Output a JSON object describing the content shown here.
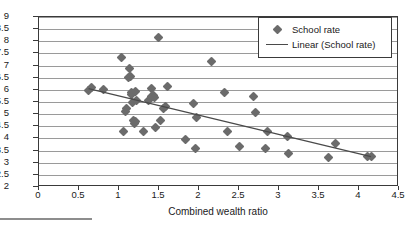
{
  "chart_data": {
    "type": "scatter",
    "title": "",
    "xlabel": "Combined wealth ratio",
    "ylabel": "",
    "xlim": [
      0,
      4.5
    ],
    "ylim": [
      2,
      9
    ],
    "xticks": [
      "0",
      "0.5",
      "1",
      "1.5",
      "2",
      "2.5",
      "3",
      "3.5",
      "4",
      "4.5"
    ],
    "xtick_values": [
      0,
      0.5,
      1,
      1.5,
      2,
      2.5,
      3,
      3.5,
      4,
      4.5
    ],
    "yticks": [
      "2",
      "2.5",
      "3",
      "3.5",
      "4",
      "4.5",
      "5",
      "5.5",
      "6",
      "6.5",
      "7",
      "7.5",
      "8",
      "8.5",
      "9"
    ],
    "ytick_values": [
      2,
      2.5,
      3,
      3.5,
      4,
      4.5,
      5,
      5.5,
      6,
      6.5,
      7,
      7.5,
      8,
      8.5,
      9
    ],
    "grid": "horizontal",
    "legend_position": "top-right",
    "marker_color": "#6b6b6b",
    "trendline_color": "#4a4a4a",
    "gridline_color": "#9a9a9a",
    "axis_color": "#3a3a3a",
    "series": [
      {
        "name": "School rate",
        "marker": "diamond",
        "points": [
          [
            0.62,
            5.97
          ],
          [
            0.66,
            6.1
          ],
          [
            0.8,
            6.03
          ],
          [
            1.03,
            7.32
          ],
          [
            1.05,
            4.27
          ],
          [
            1.08,
            5.1
          ],
          [
            1.09,
            5.22
          ],
          [
            1.12,
            6.5
          ],
          [
            1.13,
            6.88
          ],
          [
            1.14,
            6.55
          ],
          [
            1.15,
            5.88
          ],
          [
            1.16,
            5.8
          ],
          [
            1.17,
            5.47
          ],
          [
            1.18,
            4.73
          ],
          [
            1.19,
            4.62
          ],
          [
            1.2,
            5.95
          ],
          [
            1.21,
            4.68
          ],
          [
            1.22,
            5.58
          ],
          [
            1.3,
            4.3
          ],
          [
            1.37,
            5.55
          ],
          [
            1.4,
            6.07
          ],
          [
            1.41,
            5.72
          ],
          [
            1.43,
            5.78
          ],
          [
            1.44,
            5.7
          ],
          [
            1.46,
            4.43
          ],
          [
            1.49,
            8.15
          ],
          [
            1.52,
            4.75
          ],
          [
            1.55,
            5.22
          ],
          [
            1.58,
            5.3
          ],
          [
            1.6,
            6.12
          ],
          [
            1.83,
            3.95
          ],
          [
            1.93,
            5.42
          ],
          [
            1.95,
            3.58
          ],
          [
            1.97,
            4.88
          ],
          [
            2.16,
            7.17
          ],
          [
            2.32,
            5.88
          ],
          [
            2.35,
            4.3
          ],
          [
            2.51,
            3.67
          ],
          [
            2.68,
            5.72
          ],
          [
            2.7,
            5.05
          ],
          [
            2.83,
            3.6
          ],
          [
            2.85,
            4.3
          ],
          [
            3.1,
            4.07
          ],
          [
            3.12,
            3.38
          ],
          [
            3.62,
            3.22
          ],
          [
            3.7,
            3.8
          ],
          [
            4.1,
            3.25
          ],
          [
            4.15,
            3.27
          ]
        ]
      }
    ],
    "trendline": {
      "name": "Linear (School rate)",
      "x_start": 0.62,
      "y_start": 6.05,
      "x_end": 4.15,
      "y_end": 3.25
    }
  },
  "legend": {
    "entries": [
      {
        "label": "School rate",
        "key": "diamond-marker"
      },
      {
        "label": "Linear (School rate)",
        "key": "line-marker"
      }
    ]
  }
}
